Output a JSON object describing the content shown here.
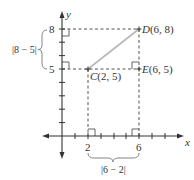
{
  "figure": {
    "axes": {
      "x_label": "x",
      "y_label": "y",
      "x_tick_labels": {
        "2": "2",
        "6": "6"
      },
      "y_tick_labels": {
        "5": "5",
        "8": "8"
      }
    },
    "points": {
      "C": {
        "name": "C",
        "coords": "(2, 5)",
        "x": 2,
        "y": 5
      },
      "D": {
        "name": "D",
        "coords": "(6, 8)",
        "x": 6,
        "y": 8
      },
      "E": {
        "name": "E",
        "coords": "(6, 5)",
        "x": 6,
        "y": 5
      }
    },
    "braces": {
      "vertical": {
        "label": "|8 − 5|"
      },
      "horizontal": {
        "label": "|6 − 2|"
      }
    },
    "colors": {
      "axis": "#333333",
      "dashed": "#555555",
      "segment": "#b8b8b8",
      "text": "#333333"
    }
  }
}
